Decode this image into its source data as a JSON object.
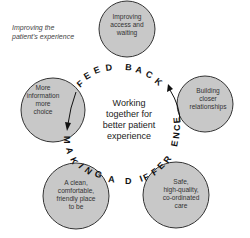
{
  "diagram": {
    "corner_label": [
      "Improving the",
      "patient's experience"
    ],
    "center": [
      "Working",
      "together for",
      "better patient",
      "experience"
    ],
    "circles": [
      {
        "id": "top",
        "lines": [
          "Improving",
          "access and",
          "waiting"
        ]
      },
      {
        "id": "right",
        "lines": [
          "Building",
          "closer",
          "relationships"
        ]
      },
      {
        "id": "bottom-right",
        "lines": [
          "Safe,",
          "high-quality,",
          "co-ordinated",
          "care"
        ]
      },
      {
        "id": "bottom-left",
        "lines": [
          "A clean,",
          "comfortable,",
          "friendly place",
          "to be"
        ]
      },
      {
        "id": "left",
        "lines": [
          "More",
          "information",
          "more",
          "choice"
        ]
      }
    ],
    "arc_labels": {
      "feedback": "FEEDBACK",
      "making_a_difference": "MAKING A DIFFERENCE"
    },
    "colors": {
      "circle_fill": "#c8c8c8",
      "circle_stroke": "#333333",
      "text": "#333333"
    },
    "arrows": [
      {
        "from": "left-circle-top",
        "to": "left-circle-bottom",
        "direction": "down"
      },
      {
        "from": "right-circle-bottom",
        "to": "right-circle-top",
        "direction": "up"
      }
    ]
  }
}
